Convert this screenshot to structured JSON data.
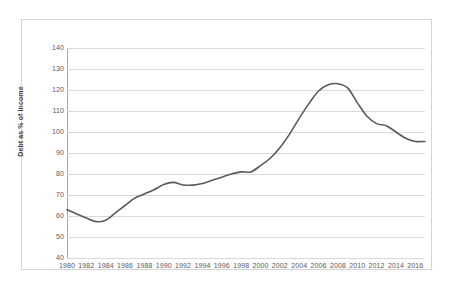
{
  "chart_data": {
    "type": "line",
    "title": "",
    "xlabel": "",
    "ylabel": "Debt as % of Income",
    "ylim": [
      40,
      140
    ],
    "ystep": 10,
    "xlim": [
      1980,
      2017
    ],
    "grid": true,
    "legend": "none",
    "line_color": "#595959",
    "y_ticks": [
      140,
      130,
      120,
      110,
      100,
      90,
      80,
      70,
      60,
      50,
      40
    ],
    "x_ticks": [
      1980,
      1982,
      1984,
      1986,
      1988,
      1990,
      1992,
      1994,
      1996,
      1998,
      2000,
      2002,
      2004,
      2006,
      2008,
      2010,
      2012,
      2014,
      2016
    ],
    "x": [
      1980,
      1981,
      1982,
      1983,
      1984,
      1985,
      1986,
      1987,
      1988,
      1989,
      1990,
      1991,
      1992,
      1993,
      1994,
      1995,
      1996,
      1997,
      1998,
      1999,
      2000,
      2001,
      2002,
      2003,
      2004,
      2005,
      2006,
      2007,
      2008,
      2009,
      2010,
      2011,
      2012,
      2013,
      2014,
      2015,
      2016,
      2017
    ],
    "series": [
      {
        "name": "Debt as % of Income",
        "values": [
          63.0,
          61.0,
          59.0,
          57.3,
          58.0,
          61.5,
          65.0,
          68.5,
          70.5,
          72.5,
          75.0,
          76.0,
          74.8,
          74.7,
          75.5,
          77.0,
          78.5,
          80.0,
          81.0,
          81.0,
          84.0,
          87.5,
          92.5,
          99.0,
          106.5,
          113.5,
          119.5,
          122.5,
          123.0,
          121.0,
          114.0,
          107.5,
          104.0,
          103.0,
          100.0,
          97.0,
          95.5,
          95.5
        ]
      }
    ]
  },
  "figure": {
    "frame_border_color": "#d3d3d3",
    "gridline_color": "#d9d9d9",
    "axis_color": "#a6a6a6",
    "tick_label_color": "#5a5a5a",
    "background": "#ffffff"
  }
}
